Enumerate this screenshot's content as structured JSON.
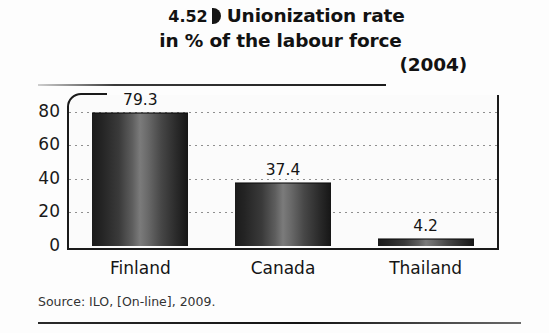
{
  "figure": {
    "number": "4.52",
    "marker_icon": "solid-half-disc-marker",
    "title_line_1": "Unionization rate",
    "title_line_2": "in % of the labour force",
    "title_line_3": "(2004)",
    "source": "Source: ILO, [On-line], 2009."
  },
  "chart_data": {
    "type": "bar",
    "categories": [
      "Finland",
      "Canada",
      "Thailand"
    ],
    "values": [
      79.3,
      37.4,
      4.2
    ],
    "value_labels": [
      "79.3",
      "37.4",
      "4.2"
    ],
    "xlabel": "",
    "ylabel": "",
    "ylim": [
      0,
      90
    ],
    "yticks": [
      0,
      20,
      40,
      60,
      80
    ],
    "ytick_labels": [
      "0",
      "20",
      "40",
      "60",
      "80"
    ],
    "grid": true,
    "grid_style": "dotted-horizontal",
    "legend": false,
    "bar_style": "vertical-gradient-grayscale",
    "source": "Source: ILO, [On-line], 2009."
  },
  "colors": {
    "bar_dark": "#1b1b1b",
    "bar_light": "#7b7b7b",
    "axis": "#1a1a1a",
    "grid": "#8f8f8f",
    "text": "#151515",
    "background": "#fdfdfd"
  }
}
